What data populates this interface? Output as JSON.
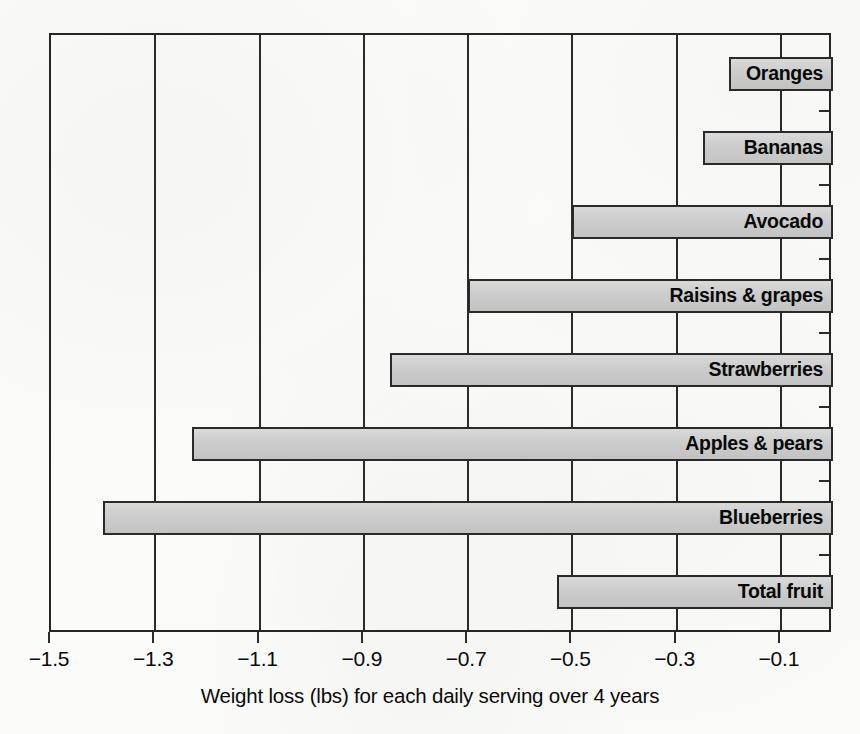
{
  "chart_data": {
    "type": "bar",
    "orientation": "horizontal",
    "title": "",
    "xlabel": "Weight loss (lbs) for each daily serving over 4 years",
    "ylabel": "",
    "categories": [
      "Oranges",
      "Bananas",
      "Avocado",
      "Raisins & grapes",
      "Strawberries",
      "Apples & pears",
      "Blueberries",
      "Total fruit"
    ],
    "values": [
      -0.2,
      -0.25,
      -0.5,
      -0.7,
      -0.85,
      -1.23,
      -1.4,
      -0.53
    ],
    "xlim": [
      -1.5,
      0.0
    ],
    "xticks": [
      -1.5,
      -1.3,
      -1.1,
      -0.9,
      -0.7,
      -0.5,
      -0.3,
      -0.1
    ],
    "xtick_labels": [
      "−1.5",
      "−1.3",
      "−1.1",
      "−0.9",
      "−0.7",
      "−0.5",
      "−0.3",
      "−0.1"
    ],
    "gridlines": [
      -1.3,
      -1.1,
      -0.9,
      -0.7,
      -0.5,
      -0.3,
      -0.1
    ],
    "grid": true,
    "legend": "none",
    "bar_fill_color": "#c9c9c9",
    "bar_border_color": "#2a2a2a",
    "axis_color": "#252525",
    "label_position": "inside-right",
    "label_style": "bold"
  }
}
